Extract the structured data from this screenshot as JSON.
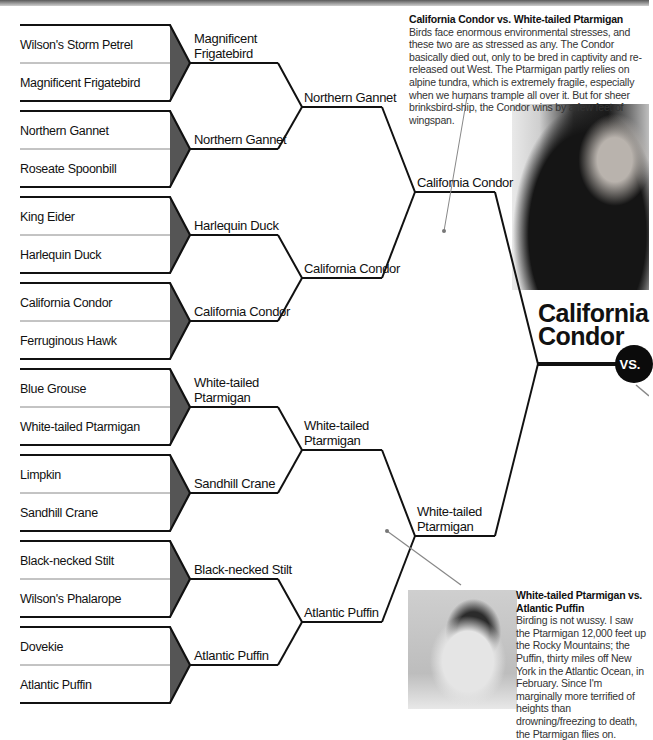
{
  "bracket": {
    "round1": [
      [
        "Wilson's Storm Petrel",
        "Magnificent Frigatebird"
      ],
      [
        "Northern Gannet",
        "Roseate Spoonbill"
      ],
      [
        "King Eider",
        "Harlequin Duck"
      ],
      [
        "California Condor",
        "Ferruginous Hawk"
      ],
      [
        "Blue Grouse",
        "White-tailed Ptarmigan"
      ],
      [
        "Limpkin",
        "Sandhill Crane"
      ],
      [
        "Black-necked Stilt",
        "Wilson's Phalarope"
      ],
      [
        "Dovekie",
        "Atlantic Puffin"
      ]
    ],
    "round2": [
      "Magnificent Frigatebird",
      "Northern Gannet",
      "Harlequin Duck",
      "California Condor",
      "White-tailed Ptarmigan",
      "Sandhill Crane",
      "Black-necked Stilt",
      "Atlantic Puffin"
    ],
    "round2_display": [
      "Magnificent\nFrigatebird",
      "Northern Gannet",
      "Harlequin Duck",
      "California Condor",
      "White-tailed\nPtarmigan",
      "Sandhill Crane",
      "Black-necked Stilt",
      "Atlantic Puffin"
    ],
    "round3": [
      "Northern Gannet",
      "California Condor",
      "White-tailed Ptarmigan",
      "Atlantic Puffin"
    ],
    "round4": [
      "California Condor",
      "White-tailed Ptarmigan"
    ],
    "champion_line1": "California",
    "champion_line2": "Condor",
    "vs_label": "VS."
  },
  "notes": {
    "condor_vs_ptarmigan": {
      "title": "California Condor vs. White-tailed Ptarmigan",
      "body": "Birds face enormous environmental stresses, and these two are as stressed as any. The Condor basically died out, only to be bred in captivity and re-released out West. The Ptarmigan partly relies on alpine tundra, which is extremely fragile, especially when we humans trample all over it. But for sheer brinksbird-ship, the Condor wins by a few feet of wingspan."
    },
    "ptarmigan_vs_puffin": {
      "title": "White-tailed Ptarmigan vs. Atlantic Puffin",
      "body": "Birding is not wussy. I saw the Ptarmigan 12,000 feet up the Rocky Mountains; the Puffin, thirty miles off New York in the Atlantic Ocean, in February. Since I'm marginally more terrified of heights than drowning/freezing to death, the Ptarmigan flies on."
    }
  },
  "photos": {
    "condor": "california-condor-photo",
    "ptarmigan": "white-tailed-ptarmigan-photo"
  },
  "colors": {
    "line": "#111111",
    "wedge": "#555555",
    "divider": "#888888"
  }
}
